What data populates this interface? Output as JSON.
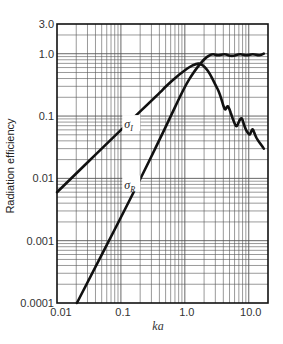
{
  "chart_data": {
    "type": "line",
    "title": "",
    "xlabel": "ka",
    "ylabel": "Radiation efficiency",
    "xscale": "log",
    "yscale": "log",
    "xlim": [
      0.01,
      20
    ],
    "ylim": [
      0.0001,
      3.0
    ],
    "grid": true,
    "x_ticks": [
      {
        "value": 0.01,
        "label": "0.01"
      },
      {
        "value": 0.1,
        "label": "0.1"
      },
      {
        "value": 1.0,
        "label": "1.0"
      },
      {
        "value": 10.0,
        "label": "10.0"
      }
    ],
    "y_ticks": [
      {
        "value": 3.0,
        "label": "3.0"
      },
      {
        "value": 1.0,
        "label": "1.0"
      },
      {
        "value": 0.1,
        "label": "0.1"
      },
      {
        "value": 0.01,
        "label": "0.01"
      },
      {
        "value": 0.001,
        "label": "0.001"
      },
      {
        "value": 0.0001,
        "label": "0.0001"
      }
    ],
    "series": [
      {
        "name": "σI",
        "label_main": "σ",
        "label_sub": "I",
        "label_pos": {
          "ka": 0.14,
          "sigma": 0.069
        },
        "color": "#111111",
        "points": [
          [
            0.01,
            0.006
          ],
          [
            0.1,
            0.06
          ],
          [
            0.41,
            0.24
          ],
          [
            0.49,
            0.29
          ],
          [
            0.8,
            0.46
          ],
          [
            1.2,
            0.62
          ],
          [
            1.5,
            0.69
          ],
          [
            1.76,
            0.7
          ],
          [
            2.1,
            0.6
          ],
          [
            2.46,
            0.48
          ],
          [
            3.0,
            0.32
          ],
          [
            3.52,
            0.23
          ],
          [
            4.21,
            0.122
          ],
          [
            4.45,
            0.135
          ],
          [
            4.69,
            0.147
          ],
          [
            5.0,
            0.13
          ],
          [
            5.42,
            0.1
          ],
          [
            6.0,
            0.075
          ],
          [
            6.49,
            0.066
          ],
          [
            7.1,
            0.085
          ],
          [
            7.78,
            0.095
          ],
          [
            8.2,
            0.08
          ],
          [
            8.66,
            0.066
          ],
          [
            9.5,
            0.055
          ],
          [
            10.4,
            0.049
          ],
          [
            11.0,
            0.058
          ],
          [
            11.6,
            0.063
          ],
          [
            12.5,
            0.05
          ],
          [
            13.8,
            0.041
          ],
          [
            15.5,
            0.035
          ],
          [
            17.2,
            0.03
          ]
        ]
      },
      {
        "name": "σR",
        "label_main": "σ",
        "label_sub": "R",
        "label_pos": {
          "ka": 0.14,
          "sigma": 0.0074
        },
        "color": "#111111",
        "points": [
          [
            0.0205,
            0.0001
          ],
          [
            0.165,
            0.0064
          ],
          [
            0.49,
            0.063
          ],
          [
            1.0,
            0.3
          ],
          [
            1.4,
            0.52
          ],
          [
            1.76,
            0.7
          ],
          [
            2.2,
            0.9
          ],
          [
            2.74,
            1.0
          ],
          [
            3.28,
            0.93
          ],
          [
            4.22,
            1.0
          ],
          [
            5.42,
            0.9
          ],
          [
            7.23,
            1.0
          ],
          [
            9.3,
            0.93
          ],
          [
            11.5,
            1.0
          ],
          [
            14.8,
            0.93
          ],
          [
            17.2,
            1.0
          ]
        ]
      }
    ]
  }
}
